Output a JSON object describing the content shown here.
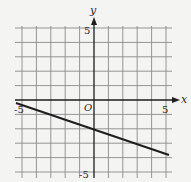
{
  "diagram": {
    "type": "coordinate-plane-line",
    "axes": {
      "x_label": "x",
      "y_label": "y",
      "origin_label": "O",
      "x_min_label": "-5",
      "x_max_label": "5",
      "y_max_label": "5",
      "y_min_label": "-5",
      "range": [
        -5,
        5
      ]
    },
    "line": {
      "slope": -0.3333,
      "y_intercept": -2,
      "description": "Line y = -x/3 - 2"
    },
    "colors": {
      "background": "#f4f4f2",
      "grid": "#8a8a8a",
      "axis": "#1e1e1e",
      "line": "#1e1e1e"
    }
  }
}
